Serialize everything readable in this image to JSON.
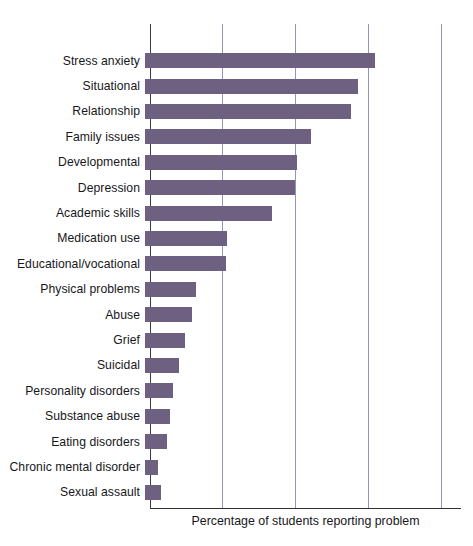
{
  "chart_data": {
    "type": "bar",
    "orientation": "horizontal",
    "title": "",
    "xlabel": "Percentage of students reporting problem",
    "ylabel": "",
    "xlim": [
      0,
      42.5
    ],
    "grid": true,
    "gridlines_at": [
      10,
      20,
      30,
      40
    ],
    "tick_labels_visible": false,
    "legend": "none",
    "bar_color": "#6e6080",
    "gridline_color": "#9096b8",
    "axis_color": "#2f2f35",
    "categories": [
      "Stress anxiety",
      "Situational",
      "Relationship",
      "Family issues",
      "Developmental",
      "Depression",
      "Academic skills",
      "Medication use",
      "Educational/vocational",
      "Physical problems",
      "Abuse",
      "Grief",
      "Suicidal",
      "Personality disorders",
      "Substance abuse",
      "Eating disorders",
      "Chronic mental disorder",
      "Sexual assault"
    ],
    "values": [
      31.6,
      29.2,
      28.2,
      22.7,
      20.8,
      20.5,
      17.4,
      11.2,
      11.1,
      7.0,
      6.4,
      5.5,
      4.7,
      3.8,
      3.4,
      3.0,
      1.8,
      2.2
    ],
    "value_unit": "percent"
  }
}
